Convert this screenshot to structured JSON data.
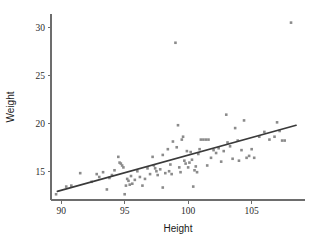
{
  "chart_data": {
    "type": "scatter",
    "title": "",
    "xlabel": "Height",
    "ylabel": "Weight",
    "xlim": [
      89.2,
      109.2
    ],
    "ylim": [
      12.0,
      31.4
    ],
    "xticks": [
      90,
      95,
      100,
      105
    ],
    "yticks": [
      15,
      20,
      25,
      30
    ],
    "grid": false,
    "legend": null,
    "point_color": "#8b8b8b",
    "line_color": "#3a3a3a",
    "axis_color": "#6d6d6d",
    "series": [
      {
        "name": "observations",
        "marker": "square",
        "points": [
          [
            89.6,
            12.6
          ],
          [
            90.4,
            13.4
          ],
          [
            90.8,
            13.5
          ],
          [
            91.5,
            14.8
          ],
          [
            92.4,
            13.9
          ],
          [
            92.8,
            14.7
          ],
          [
            93.0,
            14.4
          ],
          [
            93.3,
            14.9
          ],
          [
            93.6,
            13.1
          ],
          [
            93.8,
            14.3
          ],
          [
            94.0,
            14.6
          ],
          [
            94.2,
            15.1
          ],
          [
            94.5,
            16.5
          ],
          [
            94.6,
            15.9
          ],
          [
            94.7,
            15.8
          ],
          [
            94.8,
            15.6
          ],
          [
            94.9,
            15.4
          ],
          [
            95.0,
            12.6
          ],
          [
            95.1,
            13.5
          ],
          [
            95.2,
            14.2
          ],
          [
            95.3,
            14.0
          ],
          [
            95.4,
            13.6
          ],
          [
            95.5,
            14.5
          ],
          [
            95.6,
            13.7
          ],
          [
            95.8,
            14.1
          ],
          [
            96.0,
            15.0
          ],
          [
            96.2,
            14.4
          ],
          [
            96.4,
            13.5
          ],
          [
            96.6,
            14.2
          ],
          [
            96.8,
            15.3
          ],
          [
            97.0,
            14.7
          ],
          [
            97.2,
            16.5
          ],
          [
            97.3,
            15.6
          ],
          [
            97.4,
            15.3
          ],
          [
            97.5,
            15.0
          ],
          [
            97.6,
            14.6
          ],
          [
            97.8,
            15.2
          ],
          [
            98.0,
            13.3
          ],
          [
            98.0,
            16.7
          ],
          [
            98.2,
            14.8
          ],
          [
            98.4,
            17.3
          ],
          [
            98.5,
            15.0
          ],
          [
            98.6,
            15.7
          ],
          [
            98.7,
            14.7
          ],
          [
            98.8,
            18.1
          ],
          [
            99.0,
            28.4
          ],
          [
            99.1,
            17.5
          ],
          [
            99.2,
            19.8
          ],
          [
            99.3,
            15.4
          ],
          [
            99.4,
            14.9
          ],
          [
            99.5,
            18.3
          ],
          [
            99.6,
            18.6
          ],
          [
            99.7,
            16.1
          ],
          [
            99.8,
            15.8
          ],
          [
            99.9,
            17.1
          ],
          [
            100.0,
            15.4
          ],
          [
            100.1,
            15.9
          ],
          [
            100.2,
            17.0
          ],
          [
            100.3,
            16.2
          ],
          [
            100.4,
            13.4
          ],
          [
            100.5,
            15.1
          ],
          [
            100.6,
            15.5
          ],
          [
            100.7,
            14.9
          ],
          [
            100.8,
            16.8
          ],
          [
            100.9,
            17.3
          ],
          [
            101.0,
            18.3
          ],
          [
            101.2,
            18.3
          ],
          [
            101.4,
            18.3
          ],
          [
            101.6,
            18.3
          ],
          [
            101.5,
            15.6
          ],
          [
            101.8,
            16.4
          ],
          [
            102.0,
            17.2
          ],
          [
            102.2,
            16.9
          ],
          [
            102.4,
            17.4
          ],
          [
            102.6,
            16.0
          ],
          [
            102.8,
            17.1
          ],
          [
            103.0,
            20.9
          ],
          [
            103.1,
            18.0
          ],
          [
            103.3,
            17.6
          ],
          [
            103.5,
            16.3
          ],
          [
            103.7,
            19.5
          ],
          [
            103.9,
            18.2
          ],
          [
            104.0,
            16.1
          ],
          [
            104.2,
            17.2
          ],
          [
            104.4,
            20.3
          ],
          [
            104.6,
            16.4
          ],
          [
            104.8,
            16.6
          ],
          [
            105.0,
            17.3
          ],
          [
            105.2,
            16.4
          ],
          [
            105.6,
            18.6
          ],
          [
            106.0,
            19.1
          ],
          [
            106.4,
            18.3
          ],
          [
            106.8,
            18.6
          ],
          [
            107.0,
            20.1
          ],
          [
            107.2,
            19.2
          ],
          [
            107.4,
            18.2
          ],
          [
            107.6,
            18.2
          ],
          [
            108.1,
            30.5
          ]
        ]
      }
    ],
    "fit_line": {
      "name": "regression-line",
      "x": [
        89.7,
        108.5
      ],
      "y": [
        12.9,
        19.8
      ]
    }
  }
}
